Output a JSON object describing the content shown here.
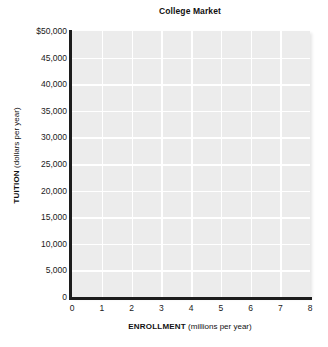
{
  "chart_data": {
    "type": "line",
    "title": "College Market",
    "xlabel_bold": "ENROLLMENT",
    "xlabel_unit": "(millions per year)",
    "ylabel_bold": "TUITION",
    "ylabel_unit": "(dollars per year)",
    "xlim": [
      0,
      8
    ],
    "ylim": [
      0,
      50000
    ],
    "xticks": [
      "0",
      "1",
      "2",
      "3",
      "4",
      "5",
      "6",
      "7",
      "8"
    ],
    "xtick_values": [
      0,
      1,
      2,
      3,
      4,
      5,
      6,
      7,
      8
    ],
    "yticks": [
      "$50,000",
      "45,000",
      "40,000",
      "35,000",
      "30,000",
      "25,000",
      "20,000",
      "15,000",
      "10,000",
      "5,000",
      "0"
    ],
    "ytick_values": [
      50000,
      45000,
      40000,
      35000,
      30000,
      25000,
      20000,
      15000,
      10000,
      5000,
      0
    ],
    "grid": true,
    "legend": null,
    "series": [],
    "annotations": [],
    "plot_background_color": "#ececec",
    "gridline_color": "#ffffff",
    "axis_color": "#1c1c1c",
    "page_background_color": "#ffffff"
  }
}
